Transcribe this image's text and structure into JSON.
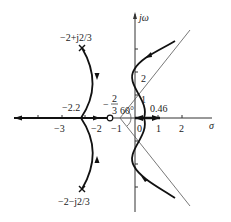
{
  "diagram": {
    "type": "root-locus",
    "axes": {
      "real_label": "σ",
      "imag_label": "jω",
      "real_ticks": [
        "-3",
        "-2",
        "-1",
        "0",
        "1",
        "2"
      ],
      "imag_ticks": [
        "1",
        "2"
      ]
    },
    "poles": [
      {
        "label": "−2+j2/3",
        "display": "−2+j2√3"
      },
      {
        "label": "−2−j2/3",
        "display": "−2−j2/3"
      },
      {
        "label": "0"
      }
    ],
    "zeros": [
      {
        "label": "−1"
      }
    ],
    "annotations": {
      "breakaway": "−2.2",
      "centroid_num": "2",
      "centroid_den": "3",
      "centroid_sign": "−",
      "angle": "60°",
      "crossing": "0.46",
      "imag_one": "1",
      "imag_two": "2"
    },
    "tick_labels": {
      "m3": "−3",
      "m2": "−2",
      "m1": "−1",
      "zero": "0",
      "p1": "1",
      "p2": "2"
    },
    "pole_labels": {
      "upper": "−2+j2/3",
      "lower": "−2−j2/3"
    },
    "colors": {
      "locus": "#111111",
      "axis": "#333333",
      "asymptote": "#555555"
    }
  }
}
